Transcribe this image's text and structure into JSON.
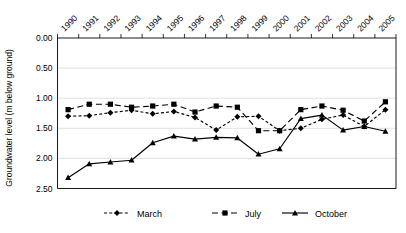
{
  "chart_data": {
    "type": "line",
    "title": "",
    "xlabel": "",
    "ylabel": "Groundwater level (m below ground)",
    "categories": [
      "1990",
      "1991",
      "1992",
      "1993",
      "1994",
      "1995",
      "1996",
      "1997",
      "1998",
      "1999",
      "2000",
      "2001",
      "2002",
      "2003",
      "2004",
      "2005"
    ],
    "ylim": [
      0.0,
      2.5
    ],
    "y_inverted": true,
    "y_ticks": [
      "0.00",
      "0.50",
      "1.00",
      "1.50",
      "2.00",
      "2.50"
    ],
    "y_tick_values": [
      0.0,
      0.5,
      1.0,
      1.5,
      2.0,
      2.5
    ],
    "grid": true,
    "legend_position": "bottom",
    "series": [
      {
        "name": "March",
        "marker": "diamond",
        "line_style": "dotted",
        "color": "#000000",
        "values": [
          1.3,
          1.29,
          1.24,
          1.2,
          1.26,
          1.22,
          1.32,
          1.53,
          1.31,
          1.3,
          1.54,
          1.5,
          1.35,
          1.28,
          1.47,
          1.19
        ]
      },
      {
        "name": "July",
        "marker": "square",
        "line_style": "dashed",
        "color": "#000000",
        "values": [
          1.19,
          1.1,
          1.1,
          1.15,
          1.13,
          1.1,
          1.23,
          1.13,
          1.15,
          1.54,
          1.54,
          1.19,
          1.13,
          1.2,
          1.38,
          1.06
        ]
      },
      {
        "name": "October",
        "marker": "triangle",
        "line_style": "solid",
        "color": "#000000",
        "values": [
          2.32,
          2.09,
          2.06,
          2.03,
          1.74,
          1.63,
          1.68,
          1.65,
          1.66,
          1.93,
          1.84,
          1.34,
          1.28,
          1.53,
          1.47,
          1.55
        ]
      }
    ]
  },
  "legend": {
    "items": [
      {
        "label": "March"
      },
      {
        "label": "July"
      },
      {
        "label": "October"
      }
    ]
  },
  "axes": {
    "y_title": "Groundwater level (m below ground)"
  }
}
